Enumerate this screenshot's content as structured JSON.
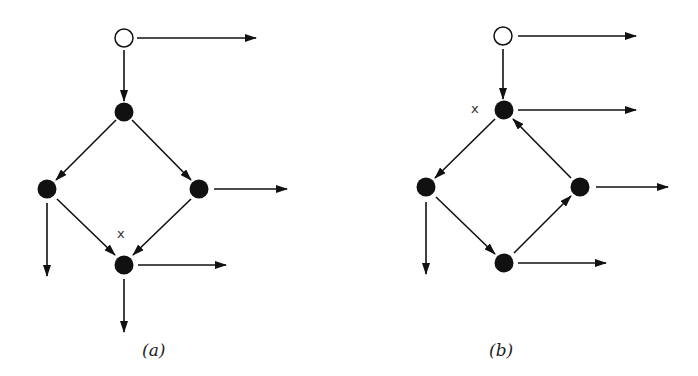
{
  "figure": {
    "panels": [
      {
        "id": "a",
        "caption": "(a)",
        "marker_label": "x",
        "nodes": [
          {
            "id": "entry",
            "type": "open",
            "x": 124,
            "y": 38
          },
          {
            "id": "top",
            "type": "filled",
            "x": 124,
            "y": 112
          },
          {
            "id": "left",
            "type": "filled",
            "x": 47,
            "y": 189
          },
          {
            "id": "right",
            "type": "filled",
            "x": 199,
            "y": 189
          },
          {
            "id": "bottom",
            "type": "filled",
            "x": 124,
            "y": 265,
            "marked": true
          }
        ],
        "edges": [
          {
            "from": "entry",
            "to": "top"
          },
          {
            "from": "top",
            "to": "left"
          },
          {
            "from": "top",
            "to": "right"
          },
          {
            "from": "left",
            "to": "bottom"
          },
          {
            "from": "right",
            "to": "bottom"
          }
        ],
        "exits": [
          {
            "from": "entry",
            "direction": "right"
          },
          {
            "from": "right",
            "direction": "right"
          },
          {
            "from": "left",
            "direction": "down"
          },
          {
            "from": "bottom",
            "direction": "right"
          },
          {
            "from": "bottom",
            "direction": "down"
          }
        ]
      },
      {
        "id": "b",
        "caption": "(b)",
        "marker_label": "x",
        "nodes": [
          {
            "id": "entry",
            "type": "open",
            "x": 503,
            "y": 36
          },
          {
            "id": "top",
            "type": "filled",
            "x": 504,
            "y": 110,
            "marked": true
          },
          {
            "id": "left",
            "type": "filled",
            "x": 426,
            "y": 187
          },
          {
            "id": "right",
            "type": "filled",
            "x": 580,
            "y": 187
          },
          {
            "id": "bottom",
            "type": "filled",
            "x": 504,
            "y": 263
          }
        ],
        "edges": [
          {
            "from": "entry",
            "to": "top"
          },
          {
            "from": "top",
            "to": "left"
          },
          {
            "from": "left",
            "to": "bottom"
          },
          {
            "from": "bottom",
            "to": "right"
          },
          {
            "from": "right",
            "to": "top"
          }
        ],
        "exits": [
          {
            "from": "entry",
            "direction": "right"
          },
          {
            "from": "top",
            "direction": "right"
          },
          {
            "from": "right",
            "direction": "right"
          },
          {
            "from": "left",
            "direction": "down"
          },
          {
            "from": "bottom",
            "direction": "right"
          }
        ]
      }
    ],
    "colors": {
      "ink": "#111111",
      "background": "#ffffff"
    }
  }
}
